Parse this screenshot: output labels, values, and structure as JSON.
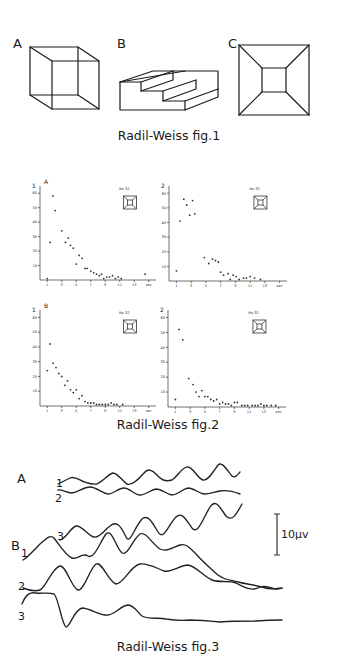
{
  "fig1": {
    "caption": "Radil-Weiss   fig.1",
    "panels": [
      {
        "label": "A",
        "figure": "necker-cube"
      },
      {
        "label": "B",
        "figure": "schroeder-staircase"
      },
      {
        "label": "C",
        "figure": "truncated-pyramid"
      }
    ]
  },
  "fig2": {
    "caption": "Radil-Weiss   fig.2",
    "unit": "sec"
  },
  "fig3": {
    "caption": "Radil-Weiss   fig.3",
    "group_a_label": "A",
    "group_b_label": "B",
    "trace_labels": {
      "a1": "1",
      "a2": "2",
      "b1": "1",
      "b2": "2",
      "b3": "3",
      "b3_top": "3"
    },
    "scale_bar": "10μv"
  },
  "chart_data": [
    {
      "type": "scatter",
      "title": "A",
      "subject": "No 32",
      "ylabel": "1",
      "xlabel": "sec",
      "yticks": [
        10,
        20,
        30,
        40,
        50,
        60
      ],
      "xticks": [
        1,
        3,
        5,
        7,
        9,
        11,
        13,
        15
      ],
      "ylim": [
        0,
        65
      ],
      "xlim": [
        0,
        16
      ],
      "points": [
        [
          1.0,
          1
        ],
        [
          1.4,
          26
        ],
        [
          1.8,
          58
        ],
        [
          2.1,
          48
        ],
        [
          3.0,
          34
        ],
        [
          3.5,
          26
        ],
        [
          3.9,
          29
        ],
        [
          4.2,
          24
        ],
        [
          4.6,
          22
        ],
        [
          5.0,
          11
        ],
        [
          5.4,
          17
        ],
        [
          5.8,
          15
        ],
        [
          6.2,
          8
        ],
        [
          6.5,
          8
        ],
        [
          7.0,
          6
        ],
        [
          7.4,
          5
        ],
        [
          7.8,
          4
        ],
        [
          8.2,
          3
        ],
        [
          8.5,
          4
        ],
        [
          8.8,
          1
        ],
        [
          9.2,
          2
        ],
        [
          9.6,
          2
        ],
        [
          10.0,
          3
        ],
        [
          10.4,
          1
        ],
        [
          10.8,
          2
        ],
        [
          11.2,
          1
        ],
        [
          14.5,
          4
        ]
      ]
    },
    {
      "type": "scatter",
      "title": "",
      "subject": "No 32",
      "ylabel": "2",
      "xlabel": "sec",
      "yticks": [
        10,
        20,
        30,
        40,
        50,
        60
      ],
      "xticks": [
        1,
        3,
        5,
        7,
        9,
        11,
        13,
        15
      ],
      "ylim": [
        0,
        65
      ],
      "xlim": [
        0,
        16
      ],
      "points": [
        [
          1.0,
          7
        ],
        [
          1.5,
          41
        ],
        [
          2.0,
          56
        ],
        [
          2.4,
          52
        ],
        [
          2.8,
          45
        ],
        [
          3.2,
          55
        ],
        [
          3.5,
          46
        ],
        [
          4.8,
          16
        ],
        [
          5.4,
          12
        ],
        [
          5.9,
          15
        ],
        [
          6.3,
          14
        ],
        [
          6.7,
          13
        ],
        [
          7.0,
          6
        ],
        [
          7.4,
          4
        ],
        [
          8.0,
          5
        ],
        [
          8.3,
          1
        ],
        [
          8.7,
          4
        ],
        [
          9.1,
          3
        ],
        [
          9.5,
          1
        ],
        [
          10.1,
          2
        ],
        [
          10.5,
          2
        ],
        [
          11.0,
          3
        ],
        [
          11.6,
          2
        ],
        [
          12.4,
          1
        ]
      ]
    },
    {
      "type": "scatter",
      "title": "B",
      "subject": "No 32",
      "ylabel": "1",
      "xlabel": "sec",
      "yticks": [
        10,
        20,
        30,
        40,
        50,
        60
      ],
      "xticks": [
        1,
        3,
        5,
        7,
        9,
        11,
        13,
        15
      ],
      "ylim": [
        0,
        65
      ],
      "xlim": [
        0,
        16
      ],
      "points": [
        [
          1.0,
          24
        ],
        [
          1.4,
          42
        ],
        [
          1.8,
          29
        ],
        [
          2.2,
          26
        ],
        [
          2.6,
          22
        ],
        [
          3.0,
          20
        ],
        [
          3.4,
          14
        ],
        [
          3.8,
          17
        ],
        [
          4.2,
          11
        ],
        [
          4.6,
          9
        ],
        [
          5.0,
          11
        ],
        [
          5.4,
          5
        ],
        [
          5.8,
          7
        ],
        [
          6.2,
          3
        ],
        [
          6.6,
          2
        ],
        [
          7.0,
          2
        ],
        [
          7.4,
          2
        ],
        [
          7.8,
          1
        ],
        [
          8.2,
          1
        ],
        [
          8.6,
          1
        ],
        [
          9.0,
          1
        ],
        [
          9.4,
          1
        ],
        [
          9.8,
          2
        ],
        [
          10.2,
          1
        ],
        [
          10.6,
          1
        ],
        [
          11.4,
          1
        ]
      ]
    },
    {
      "type": "scatter",
      "title": "",
      "subject": "No 32",
      "ylabel": "2",
      "xlabel": "sec",
      "yticks": [
        10,
        20,
        30,
        40,
        50,
        60
      ],
      "xticks": [
        1,
        3,
        5,
        7,
        9,
        11,
        13,
        15
      ],
      "ylim": [
        0,
        65
      ],
      "xlim": [
        0,
        16
      ],
      "points": [
        [
          1.0,
          5
        ],
        [
          1.5,
          52
        ],
        [
          2.0,
          45
        ],
        [
          2.8,
          19
        ],
        [
          3.4,
          15
        ],
        [
          3.8,
          10
        ],
        [
          4.2,
          7
        ],
        [
          4.6,
          11
        ],
        [
          5.0,
          7
        ],
        [
          5.4,
          7
        ],
        [
          5.8,
          5
        ],
        [
          6.2,
          4
        ],
        [
          6.6,
          5
        ],
        [
          7.0,
          2
        ],
        [
          7.4,
          3
        ],
        [
          7.8,
          2
        ],
        [
          8.2,
          2
        ],
        [
          8.6,
          1
        ],
        [
          9.0,
          3
        ],
        [
          9.4,
          3
        ],
        [
          10.0,
          1
        ],
        [
          10.4,
          1
        ],
        [
          10.8,
          1
        ],
        [
          11.4,
          1
        ],
        [
          11.8,
          1
        ],
        [
          12.2,
          1
        ],
        [
          12.6,
          2
        ],
        [
          13.0,
          1
        ],
        [
          13.4,
          1
        ],
        [
          14.0,
          1
        ],
        [
          14.6,
          1
        ]
      ]
    }
  ]
}
